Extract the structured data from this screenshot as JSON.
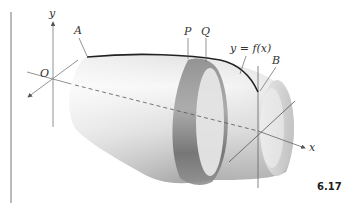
{
  "figure": {
    "number": "6.17",
    "labels": {
      "y_axis": "y",
      "x_axis": "x",
      "origin": "O",
      "point_a": "A",
      "point_b": "B",
      "point_p": "P",
      "point_q": "Q",
      "curve": "y = f(x)"
    },
    "colors": {
      "axis": "#666666",
      "curve": "#222222",
      "surface_light": "#f2f2f2",
      "surface_dark": "#9a9a9a",
      "band": "#808080"
    }
  }
}
